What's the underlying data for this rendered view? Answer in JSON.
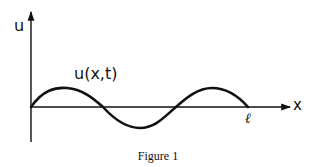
{
  "figure": {
    "caption": "Figure 1",
    "y_axis_label": "u",
    "x_axis_label": "x",
    "function_label": "u(x,t)",
    "endpoint_label": "ℓ"
  },
  "diagram": {
    "type": "string displacement (standing wave) sketch",
    "curve": "sinusoid u(x,t) from x=0 to x=ℓ with 1.5 periods (3 half-waves: up, down, up)",
    "line_color": "#111111",
    "background": "#ffffff"
  }
}
